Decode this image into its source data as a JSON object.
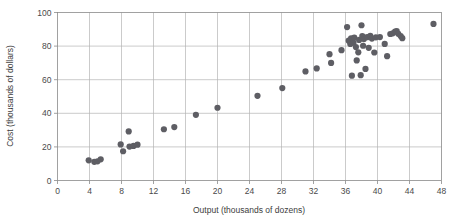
{
  "chart_data": {
    "type": "scatter",
    "title": "",
    "xlabel": "Output (thousands of dozens)",
    "ylabel": "Cost (thousands of dollars)",
    "xlim": [
      0,
      48
    ],
    "ylim": [
      0,
      100
    ],
    "xticks": [
      0,
      4,
      8,
      12,
      16,
      20,
      24,
      28,
      32,
      36,
      40,
      44,
      48
    ],
    "yticks": [
      0,
      20,
      40,
      60,
      80,
      100
    ],
    "xtick_labels": [
      "0",
      "4",
      "8",
      "12",
      "16",
      "20",
      "24",
      "28",
      "32",
      "36",
      "40",
      "44",
      "48"
    ],
    "ytick_labels": [
      "0",
      "20",
      "40",
      "60",
      "80",
      "100"
    ],
    "grid": true,
    "legend": null,
    "marker": {
      "shape": "circle",
      "color": "#5e5e64",
      "size_px": 3.1
    },
    "points": [
      [
        3.9,
        12.0
      ],
      [
        4.6,
        11.1
      ],
      [
        5.0,
        11.4
      ],
      [
        5.4,
        12.6
      ],
      [
        7.9,
        21.5
      ],
      [
        8.2,
        17.4
      ],
      [
        8.9,
        29.2
      ],
      [
        9.0,
        20.2
      ],
      [
        9.5,
        20.6
      ],
      [
        10.0,
        21.3
      ],
      [
        13.3,
        30.5
      ],
      [
        14.6,
        31.8
      ],
      [
        17.3,
        39.1
      ],
      [
        20.0,
        43.3
      ],
      [
        25.0,
        50.4
      ],
      [
        28.1,
        55.0
      ],
      [
        31.0,
        64.9
      ],
      [
        32.4,
        66.7
      ],
      [
        34.0,
        75.2
      ],
      [
        34.2,
        70.0
      ],
      [
        35.5,
        77.6
      ],
      [
        36.2,
        91.3
      ],
      [
        36.4,
        83.2
      ],
      [
        36.6,
        81.3
      ],
      [
        36.7,
        84.6
      ],
      [
        36.8,
        62.4
      ],
      [
        37.0,
        82.0
      ],
      [
        37.1,
        85.0
      ],
      [
        37.3,
        79.4
      ],
      [
        37.4,
        71.5
      ],
      [
        37.6,
        76.3
      ],
      [
        37.7,
        83.7
      ],
      [
        37.9,
        62.7
      ],
      [
        38.0,
        92.4
      ],
      [
        38.1,
        86.0
      ],
      [
        38.2,
        80.2
      ],
      [
        38.3,
        84.2
      ],
      [
        38.5,
        66.4
      ],
      [
        38.7,
        85.3
      ],
      [
        38.9,
        79.0
      ],
      [
        39.1,
        86.1
      ],
      [
        39.3,
        84.5
      ],
      [
        39.6,
        76.2
      ],
      [
        39.8,
        85.2
      ],
      [
        40.3,
        85.4
      ],
      [
        40.9,
        81.3
      ],
      [
        41.2,
        74.0
      ],
      [
        41.6,
        87.2
      ],
      [
        41.9,
        87.6
      ],
      [
        42.2,
        88.6
      ],
      [
        42.4,
        88.9
      ],
      [
        42.6,
        87.3
      ],
      [
        42.9,
        86.0
      ],
      [
        43.1,
        84.7
      ],
      [
        47.0,
        93.2
      ]
    ]
  },
  "colors": {
    "marker": "#5e5e64",
    "grid": "#b5b5b5",
    "frame": "#8a8a8a",
    "text": "#3d3d3d",
    "background": "#ffffff"
  }
}
